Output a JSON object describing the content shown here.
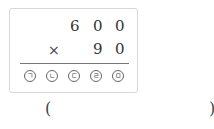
{
  "problem": {
    "multiplicand": [
      "6",
      "0",
      "0"
    ],
    "operator": "×",
    "multiplier": [
      "9",
      "0"
    ],
    "answer_slots": [
      "ㄱ",
      "ㄴ",
      "ㄷ",
      "ㄹ",
      "ㅁ"
    ]
  },
  "answer_blank": {
    "open_paren": "(",
    "close_paren": ")",
    "value": ""
  }
}
